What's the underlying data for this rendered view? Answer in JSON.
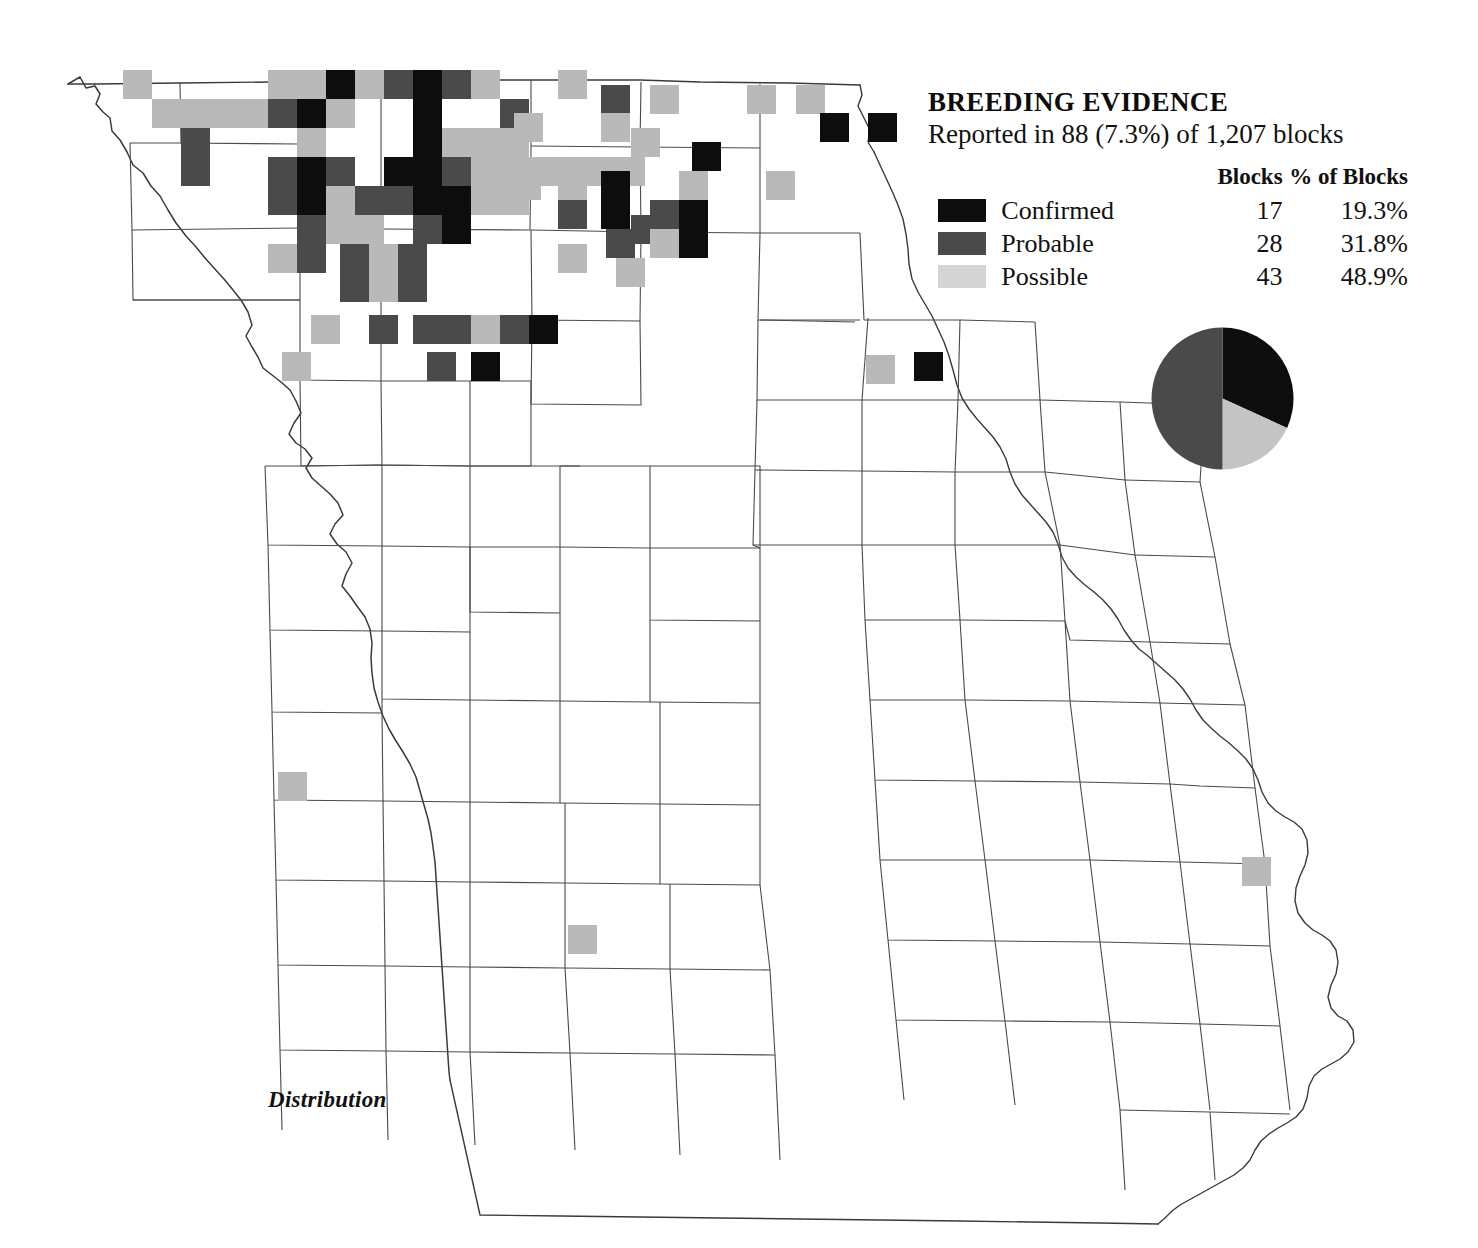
{
  "legend": {
    "title": "BREEDING EVIDENCE",
    "subtitle": "Reported in 88 (7.3%) of 1,207 blocks",
    "header_blocks": "Blocks",
    "header_pct": "% of Blocks",
    "rows": [
      {
        "label": "Confirmed",
        "blocks": "17",
        "pct": "19.3%",
        "swatch": "confirmed",
        "color": "#0d0d0d"
      },
      {
        "label": "Probable",
        "blocks": "28",
        "pct": "31.8%",
        "swatch": "probable",
        "color": "#4a4a4a"
      },
      {
        "label": "Possible",
        "blocks": "43",
        "pct": "48.9%",
        "swatch": "possible",
        "color": "#d4d4d4"
      }
    ]
  },
  "caption": "Distribution",
  "chart_data": {
    "type": "pie",
    "title": "BREEDING EVIDENCE",
    "subtitle": "Reported in 88 (7.3%) of 1,207 blocks",
    "legend_position": "above-left",
    "labels": [
      "Confirmed",
      "Probable",
      "Possible"
    ],
    "values": [
      17,
      28,
      43
    ],
    "percents": [
      19.3,
      31.8,
      48.9
    ],
    "total_blocks_reported": 88,
    "total_blocks": 1207,
    "percent_of_all_blocks": 7.3,
    "colors": [
      "#0d0d0d",
      "#4a4a4a",
      "#d4d4d4"
    ],
    "slices_as_drawn": [
      {
        "fill": "#0d0d0d",
        "start_deg": 0,
        "end_deg": 114.5,
        "percent": 31.8
      },
      {
        "fill": "#c4c4c4",
        "start_deg": 114.5,
        "end_deg": 180,
        "percent": 18.2
      },
      {
        "fill": "#4a4a4a",
        "start_deg": 180,
        "end_deg": 360,
        "percent": 50.0
      }
    ]
  },
  "map": {
    "region": "Missouri",
    "grid_block_px": 29,
    "categories": {
      "confirmed": "#0d0d0d",
      "probable": "#4a4a4a",
      "possible": "#b9b9b9"
    },
    "blocks": [
      {
        "x": 123,
        "y": 70,
        "c": "possible"
      },
      {
        "x": 152,
        "y": 99,
        "c": "possible"
      },
      {
        "x": 181,
        "y": 99,
        "c": "possible"
      },
      {
        "x": 210,
        "y": 99,
        "c": "possible"
      },
      {
        "x": 239,
        "y": 99,
        "c": "possible"
      },
      {
        "x": 181,
        "y": 128,
        "c": "probable"
      },
      {
        "x": 181,
        "y": 157,
        "c": "probable"
      },
      {
        "x": 268,
        "y": 70,
        "c": "possible"
      },
      {
        "x": 268,
        "y": 99,
        "c": "probable"
      },
      {
        "x": 297,
        "y": 99,
        "c": "confirmed"
      },
      {
        "x": 297,
        "y": 70,
        "c": "possible"
      },
      {
        "x": 326,
        "y": 70,
        "c": "confirmed"
      },
      {
        "x": 355,
        "y": 70,
        "c": "possible"
      },
      {
        "x": 384,
        "y": 70,
        "c": "probable"
      },
      {
        "x": 413,
        "y": 70,
        "c": "confirmed"
      },
      {
        "x": 442,
        "y": 70,
        "c": "probable"
      },
      {
        "x": 471,
        "y": 70,
        "c": "possible"
      },
      {
        "x": 326,
        "y": 99,
        "c": "possible"
      },
      {
        "x": 413,
        "y": 99,
        "c": "confirmed"
      },
      {
        "x": 500,
        "y": 99,
        "c": "probable"
      },
      {
        "x": 413,
        "y": 128,
        "c": "confirmed"
      },
      {
        "x": 442,
        "y": 128,
        "c": "possible"
      },
      {
        "x": 471,
        "y": 128,
        "c": "possible"
      },
      {
        "x": 500,
        "y": 128,
        "c": "possible"
      },
      {
        "x": 297,
        "y": 128,
        "c": "possible"
      },
      {
        "x": 268,
        "y": 157,
        "c": "probable"
      },
      {
        "x": 297,
        "y": 157,
        "c": "confirmed"
      },
      {
        "x": 326,
        "y": 157,
        "c": "probable"
      },
      {
        "x": 384,
        "y": 157,
        "c": "confirmed"
      },
      {
        "x": 413,
        "y": 157,
        "c": "confirmed"
      },
      {
        "x": 442,
        "y": 157,
        "c": "probable"
      },
      {
        "x": 471,
        "y": 157,
        "c": "possible"
      },
      {
        "x": 500,
        "y": 157,
        "c": "possible"
      },
      {
        "x": 529,
        "y": 157,
        "c": "possible"
      },
      {
        "x": 268,
        "y": 186,
        "c": "probable"
      },
      {
        "x": 297,
        "y": 186,
        "c": "confirmed"
      },
      {
        "x": 326,
        "y": 186,
        "c": "possible"
      },
      {
        "x": 355,
        "y": 186,
        "c": "probable"
      },
      {
        "x": 384,
        "y": 186,
        "c": "probable"
      },
      {
        "x": 413,
        "y": 186,
        "c": "confirmed"
      },
      {
        "x": 442,
        "y": 186,
        "c": "confirmed"
      },
      {
        "x": 471,
        "y": 186,
        "c": "possible"
      },
      {
        "x": 500,
        "y": 186,
        "c": "possible"
      },
      {
        "x": 297,
        "y": 215,
        "c": "probable"
      },
      {
        "x": 326,
        "y": 215,
        "c": "possible"
      },
      {
        "x": 355,
        "y": 215,
        "c": "possible"
      },
      {
        "x": 413,
        "y": 215,
        "c": "probable"
      },
      {
        "x": 442,
        "y": 215,
        "c": "confirmed"
      },
      {
        "x": 268,
        "y": 244,
        "c": "possible"
      },
      {
        "x": 297,
        "y": 244,
        "c": "probable"
      },
      {
        "x": 340,
        "y": 244,
        "c": "probable"
      },
      {
        "x": 369,
        "y": 244,
        "c": "possible"
      },
      {
        "x": 398,
        "y": 244,
        "c": "probable"
      },
      {
        "x": 340,
        "y": 273,
        "c": "probable"
      },
      {
        "x": 369,
        "y": 273,
        "c": "possible"
      },
      {
        "x": 398,
        "y": 273,
        "c": "probable"
      },
      {
        "x": 311,
        "y": 315,
        "c": "possible"
      },
      {
        "x": 369,
        "y": 315,
        "c": "probable"
      },
      {
        "x": 413,
        "y": 315,
        "c": "probable"
      },
      {
        "x": 442,
        "y": 315,
        "c": "probable"
      },
      {
        "x": 471,
        "y": 315,
        "c": "possible"
      },
      {
        "x": 500,
        "y": 315,
        "c": "probable"
      },
      {
        "x": 529,
        "y": 315,
        "c": "confirmed"
      },
      {
        "x": 282,
        "y": 352,
        "c": "possible"
      },
      {
        "x": 427,
        "y": 352,
        "c": "probable"
      },
      {
        "x": 471,
        "y": 352,
        "c": "confirmed"
      },
      {
        "x": 558,
        "y": 70,
        "c": "possible"
      },
      {
        "x": 601,
        "y": 85,
        "c": "probable"
      },
      {
        "x": 650,
        "y": 85,
        "c": "possible"
      },
      {
        "x": 747,
        "y": 85,
        "c": "possible"
      },
      {
        "x": 796,
        "y": 85,
        "c": "possible"
      },
      {
        "x": 820,
        "y": 113,
        "c": "confirmed"
      },
      {
        "x": 868,
        "y": 113,
        "c": "confirmed"
      },
      {
        "x": 514,
        "y": 113,
        "c": "possible"
      },
      {
        "x": 601,
        "y": 113,
        "c": "possible"
      },
      {
        "x": 631,
        "y": 128,
        "c": "possible"
      },
      {
        "x": 558,
        "y": 157,
        "c": "possible"
      },
      {
        "x": 587,
        "y": 157,
        "c": "possible"
      },
      {
        "x": 616,
        "y": 157,
        "c": "possible"
      },
      {
        "x": 692,
        "y": 142,
        "c": "confirmed"
      },
      {
        "x": 512,
        "y": 171,
        "c": "possible"
      },
      {
        "x": 558,
        "y": 186,
        "c": "possible"
      },
      {
        "x": 601,
        "y": 171,
        "c": "confirmed"
      },
      {
        "x": 679,
        "y": 171,
        "c": "possible"
      },
      {
        "x": 766,
        "y": 171,
        "c": "possible"
      },
      {
        "x": 558,
        "y": 200,
        "c": "probable"
      },
      {
        "x": 601,
        "y": 200,
        "c": "confirmed"
      },
      {
        "x": 650,
        "y": 200,
        "c": "probable"
      },
      {
        "x": 679,
        "y": 200,
        "c": "confirmed"
      },
      {
        "x": 631,
        "y": 215,
        "c": "probable"
      },
      {
        "x": 606,
        "y": 229,
        "c": "probable"
      },
      {
        "x": 650,
        "y": 229,
        "c": "possible"
      },
      {
        "x": 679,
        "y": 229,
        "c": "confirmed"
      },
      {
        "x": 558,
        "y": 244,
        "c": "possible"
      },
      {
        "x": 616,
        "y": 258,
        "c": "possible"
      },
      {
        "x": 866,
        "y": 355,
        "c": "possible"
      },
      {
        "x": 914,
        "y": 352,
        "c": "confirmed"
      },
      {
        "x": 278,
        "y": 772,
        "c": "possible"
      },
      {
        "x": 568,
        "y": 925,
        "c": "possible"
      },
      {
        "x": 1242,
        "y": 857,
        "c": "possible"
      }
    ]
  }
}
